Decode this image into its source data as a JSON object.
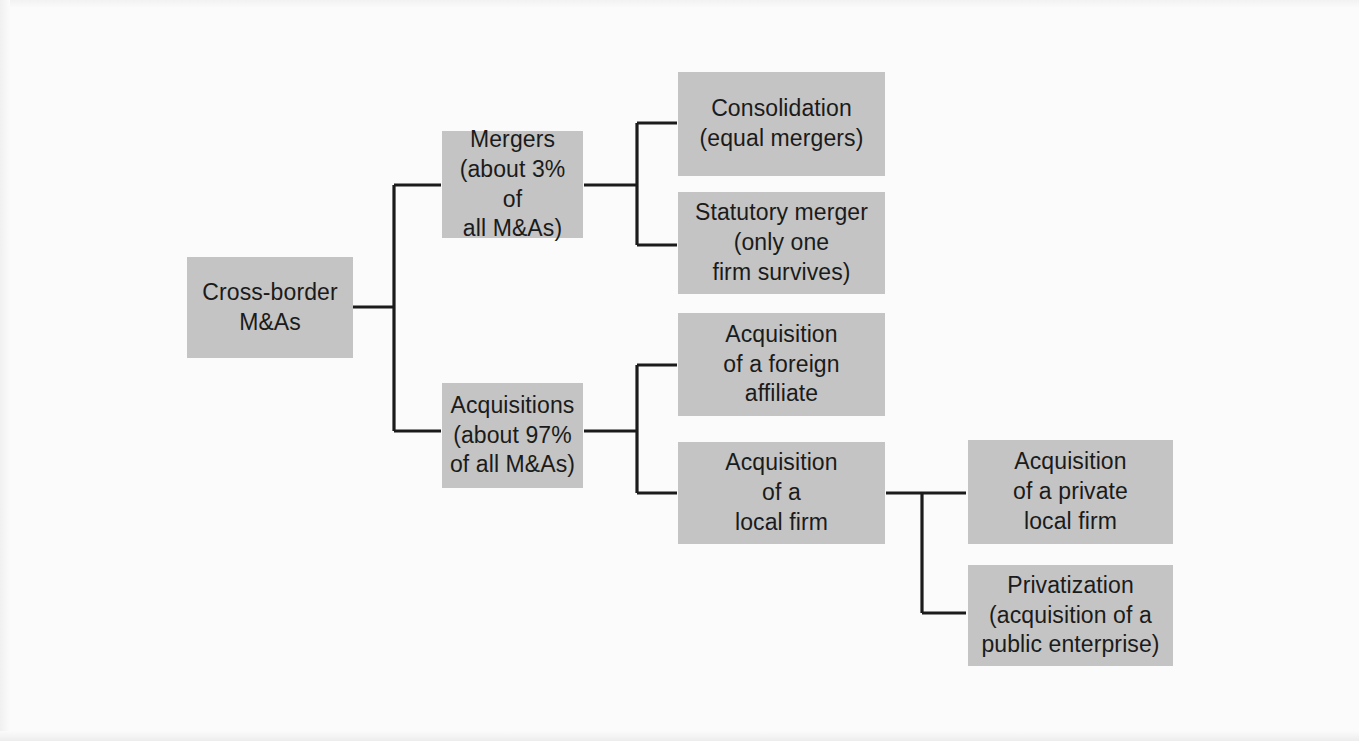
{
  "diagram": {
    "colors": {
      "background": "#fbfbfb",
      "node_fill": "#c4c4c4",
      "node_text": "#1b1b1b",
      "connector": "#1b1b1b"
    },
    "nodes": {
      "root": {
        "label": "Cross-border\nM&As",
        "x": 187,
        "y": 257,
        "w": 166,
        "h": 101
      },
      "mergers": {
        "label": "Mergers\n(about 3% of\nall M&As)",
        "x": 442,
        "y": 131,
        "w": 141,
        "h": 107
      },
      "acquisitions": {
        "label": "Acquisitions\n(about 97%\nof all M&As)",
        "x": 442,
        "y": 383,
        "w": 141,
        "h": 105
      },
      "consolidation": {
        "label": "Consolidation\n(equal mergers)",
        "x": 678,
        "y": 72,
        "w": 207,
        "h": 104
      },
      "statutory_merger": {
        "label": "Statutory merger\n(only one\nfirm survives)",
        "x": 678,
        "y": 192,
        "w": 207,
        "h": 102
      },
      "foreign_affiliate": {
        "label": "Acquisition\nof a foreign\naffiliate",
        "x": 678,
        "y": 313,
        "w": 207,
        "h": 103
      },
      "local_firm": {
        "label": "Acquisition\nof a\nlocal firm",
        "x": 678,
        "y": 442,
        "w": 207,
        "h": 102
      },
      "private_local_firm": {
        "label": "Acquisition\nof a private\nlocal firm",
        "x": 968,
        "y": 440,
        "w": 205,
        "h": 104
      },
      "privatization": {
        "label": "Privatization\n(acquisition of a\npublic enterprise)",
        "x": 968,
        "y": 565,
        "w": 205,
        "h": 101
      }
    },
    "edges": [
      {
        "name": "root-to-mergers-and-acquisitions",
        "from": "root",
        "to": [
          "mergers",
          "acquisitions"
        ]
      },
      {
        "name": "mergers-to-consolidation-and-statutory",
        "from": "mergers",
        "to": [
          "consolidation",
          "statutory_merger"
        ]
      },
      {
        "name": "acquisitions-to-foreign-and-local",
        "from": "acquisitions",
        "to": [
          "foreign_affiliate",
          "local_firm"
        ]
      },
      {
        "name": "local-firm-to-private-and-privatization",
        "from": "local_firm",
        "to": [
          "private_local_firm",
          "privatization"
        ]
      }
    ]
  }
}
